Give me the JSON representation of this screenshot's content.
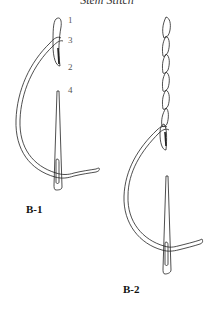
{
  "title": "Stem Stitch",
  "figures": [
    {
      "id": "B-1",
      "label": "B-1",
      "step_numbers": [
        "1",
        "3",
        "2",
        "4"
      ]
    },
    {
      "id": "B-2",
      "label": "B-2"
    }
  ]
}
